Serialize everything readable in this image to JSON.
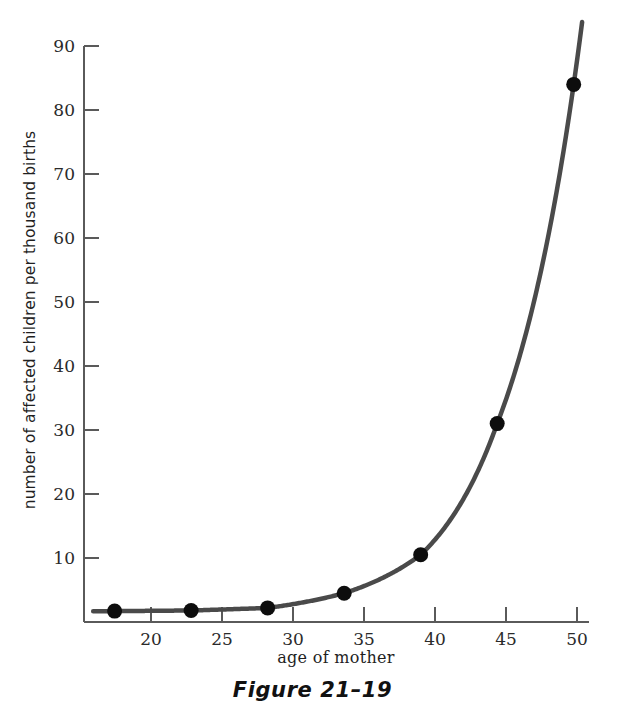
{
  "chart_data": {
    "type": "line",
    "title": "",
    "subtitle": "",
    "xlabel": "age of mother",
    "ylabel": "number of affected children per thousand births",
    "x": [
      20,
      25,
      30,
      35,
      40,
      45,
      50
    ],
    "values": [
      1.7,
      1.8,
      2.2,
      4.5,
      10.5,
      31.0,
      84.0
    ],
    "series": [
      {
        "name": "affected children per thousand births",
        "values": [
          1.7,
          1.8,
          2.2,
          4.5,
          10.5,
          31.0,
          84.0
        ]
      }
    ],
    "xlim": [
      18.0,
      51.0
    ],
    "ylim": [
      0,
      90
    ],
    "xticks": [
      20,
      25,
      30,
      35,
      40,
      45,
      50
    ],
    "yticks": [
      10,
      20,
      30,
      40,
      50,
      60,
      70,
      80,
      90
    ],
    "xtick_labels": [
      "20",
      "25",
      "30",
      "35",
      "40",
      "45",
      "50"
    ],
    "ytick_labels": [
      "10",
      "20",
      "30",
      "40",
      "50",
      "60",
      "70",
      "80",
      "90"
    ],
    "grid": false,
    "legend": "none",
    "markers": "filled-circle",
    "line_color": "#4a4a4a",
    "marker_color": "#0d0d0d",
    "axis_color": "#5a5a5a",
    "background_color": "#ffffff",
    "curve_extends_beyond_last_point": true
  },
  "caption": {
    "text": "Figure 21–19"
  },
  "axes": {
    "x_label": "age of mother",
    "y_label": "number of affected children per thousand births"
  }
}
